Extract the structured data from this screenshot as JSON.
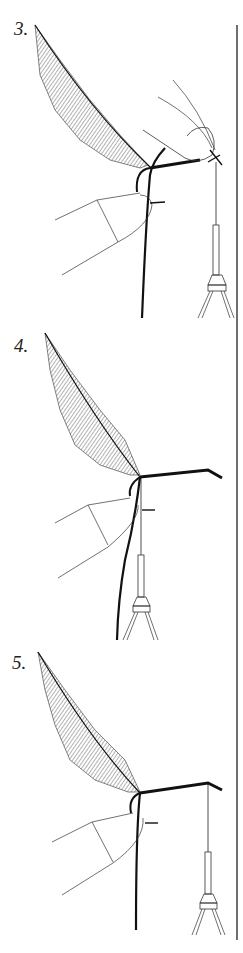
{
  "figure": {
    "steps": [
      {
        "label": "3.",
        "description": "feather tied at hook, thumb and finger holding hackle pliers"
      },
      {
        "label": "4.",
        "description": "hackle wrapped, pliers hanging"
      },
      {
        "label": "5.",
        "description": "hackle secured, pliers hanging from hook eye"
      }
    ],
    "colors": {
      "line": "#1a1a1a",
      "background": "#ffffff"
    }
  }
}
